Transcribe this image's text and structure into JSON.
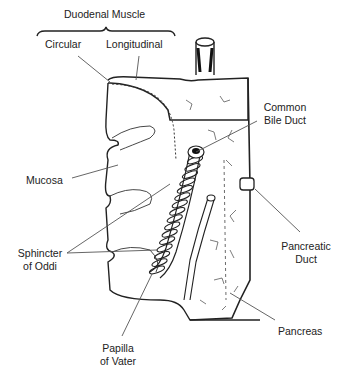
{
  "diagram": {
    "labels": {
      "duodenal_muscle": "Duodenal Muscle",
      "circular": "Circular",
      "longitudinal": "Longitudinal",
      "common_bile_duct_line1": "Common",
      "common_bile_duct_line2": "Bile Duct",
      "mucosa": "Mucosa",
      "sphincter_line1": "Sphincter",
      "sphincter_line2": "of Oddi",
      "pancreatic_duct_line1": "Pancreatic",
      "pancreatic_duct_line2": "Duct",
      "pancreas": "Pancreas",
      "papilla_line1": "Papilla",
      "papilla_line2": "of Vater"
    },
    "colors": {
      "ink": "#222222",
      "leader": "#555555",
      "background": "#ffffff"
    }
  }
}
